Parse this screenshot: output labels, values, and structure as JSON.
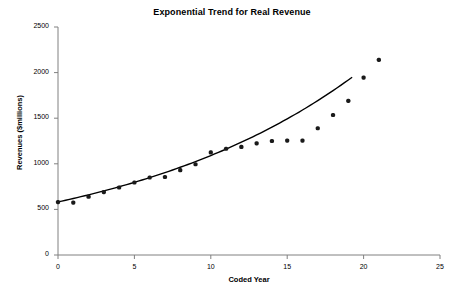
{
  "chart_data": {
    "type": "scatter",
    "title": "Exponential Trend for Real Revenue",
    "xlabel": "Coded Year",
    "ylabel": "Revenues ($millions)",
    "xlim": [
      0,
      25
    ],
    "ylim": [
      0,
      2500
    ],
    "xticks": [
      0,
      5,
      10,
      15,
      20,
      25
    ],
    "yticks": [
      0,
      500,
      1000,
      1500,
      2000,
      2500
    ],
    "grid": false,
    "legend": "none",
    "marker_color": "#1a1a1a",
    "trendline_color": "#000000",
    "x": [
      0,
      1,
      2,
      3,
      4,
      5,
      6,
      7,
      8,
      9,
      10,
      11,
      12,
      13,
      14,
      15,
      16,
      17,
      18,
      19,
      20,
      21
    ],
    "series": [
      {
        "name": "Real Revenue",
        "type": "scatter",
        "values": [
          580,
          575,
          640,
          690,
          740,
          795,
          850,
          855,
          930,
          995,
          1125,
          1165,
          1185,
          1225,
          1250,
          1255,
          1255,
          1390,
          1535,
          1690,
          1945,
          2140
        ]
      },
      {
        "name": "Exponential trend",
        "type": "line",
        "values": [
          582,
          620,
          660,
          703,
          749,
          797,
          849,
          904,
          963,
          1025,
          1092,
          1163,
          1238,
          1318,
          1404,
          1495,
          1592,
          1695,
          1805,
          1922,
          1922,
          1922
        ]
      }
    ]
  },
  "axes": {
    "y_tick_labels": [
      "0",
      "500",
      "1000",
      "1500",
      "2000",
      "2500"
    ],
    "x_tick_labels": [
      "0",
      "5",
      "10",
      "15",
      "20",
      "25"
    ]
  }
}
